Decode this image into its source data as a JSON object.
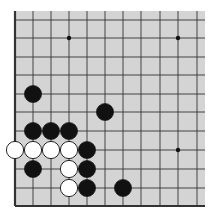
{
  "board": {
    "background": "#d4d4d4",
    "line_color": "#333333",
    "edges": [
      "left",
      "bottom"
    ],
    "columns_x": [
      15,
      33,
      51,
      69,
      87,
      105,
      123,
      141,
      160,
      178,
      197
    ],
    "rows_y": [
      20,
      38,
      57,
      75,
      94,
      112,
      131,
      150,
      169,
      188,
      206
    ],
    "extent": {
      "left": 15,
      "right": 205,
      "top": 11,
      "bottom": 206
    },
    "star_points": [
      [
        3,
        1
      ],
      [
        9,
        1
      ],
      [
        9,
        7
      ]
    ],
    "stones": [
      {
        "color": "black",
        "col": 1,
        "row": 4
      },
      {
        "color": "black",
        "col": 5,
        "row": 5
      },
      {
        "color": "black",
        "col": 1,
        "row": 6
      },
      {
        "color": "black",
        "col": 2,
        "row": 6
      },
      {
        "color": "black",
        "col": 3,
        "row": 6
      },
      {
        "color": "white",
        "col": 0,
        "row": 7
      },
      {
        "color": "white",
        "col": 1,
        "row": 7
      },
      {
        "color": "white",
        "col": 2,
        "row": 7
      },
      {
        "color": "white",
        "col": 3,
        "row": 7
      },
      {
        "color": "black",
        "col": 4,
        "row": 7
      },
      {
        "color": "black",
        "col": 1,
        "row": 8
      },
      {
        "color": "white",
        "col": 3,
        "row": 8
      },
      {
        "color": "black",
        "col": 4,
        "row": 8
      },
      {
        "color": "white",
        "col": 3,
        "row": 9
      },
      {
        "color": "black",
        "col": 4,
        "row": 9
      },
      {
        "color": "black",
        "col": 6,
        "row": 9
      }
    ]
  }
}
